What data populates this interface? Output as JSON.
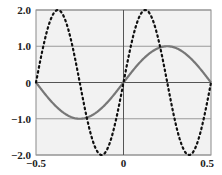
{
  "chart_data": {
    "type": "line",
    "title": "",
    "xlabel": "",
    "ylabel": "",
    "xlim": [
      -0.5,
      0.5
    ],
    "ylim": [
      -2.0,
      2.0
    ],
    "grid": true,
    "legend": null,
    "x_ticks": [
      "-0.5",
      "0",
      "0.5"
    ],
    "y_ticks": [
      "2.0",
      "1.0",
      "0",
      "-1.0",
      "-2.0"
    ],
    "series": [
      {
        "name": "solid",
        "style": "solid",
        "color": "#777777",
        "function": "1.0*sin(2*pi*x)",
        "x": [
          -0.5,
          -0.375,
          -0.25,
          -0.125,
          0,
          0.125,
          0.25,
          0.375,
          0.5
        ],
        "values": [
          0,
          -0.71,
          -1.0,
          -0.71,
          0,
          0.71,
          1.0,
          0.71,
          0
        ]
      },
      {
        "name": "dotted",
        "style": "dotted",
        "color": "#111111",
        "function": "2.0*sin(4*pi*x)",
        "x": [
          -0.5,
          -0.375,
          -0.25,
          -0.125,
          0,
          0.125,
          0.25,
          0.375,
          0.5
        ],
        "values": [
          0,
          -2.0,
          0,
          2.0,
          0,
          -2.0,
          0,
          2.0,
          0
        ]
      }
    ]
  },
  "colors": {
    "plot_bg": "#f2f2f2",
    "grid": "#9a9a9a",
    "border": "#8a8a8a",
    "axis_zero": "#555555"
  }
}
